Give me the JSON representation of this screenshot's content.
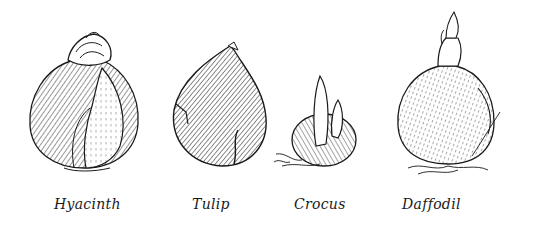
{
  "illustration": {
    "style": "black ink pen sketch on white",
    "ink_color": "#1a1a1a",
    "background": "#ffffff",
    "bulbs": [
      {
        "id": "hyacinth",
        "label": "Hyacinth"
      },
      {
        "id": "tulip",
        "label": "Tulip"
      },
      {
        "id": "crocus",
        "label": "Crocus"
      },
      {
        "id": "daffodil",
        "label": "Daffodil"
      }
    ]
  }
}
